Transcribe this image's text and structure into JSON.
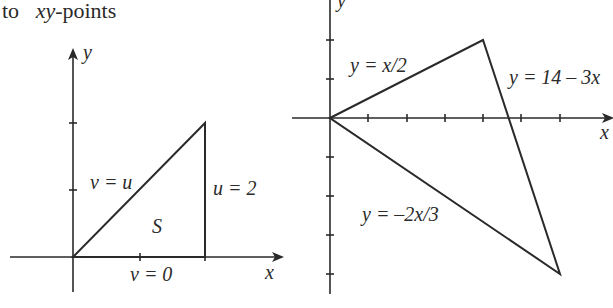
{
  "caption": {
    "prefix": "to",
    "var": "xy",
    "suffix": "-points"
  },
  "left_diagram": {
    "axis_x_label": "x",
    "axis_y_label": "y",
    "region_label": "S",
    "edges": {
      "hypotenuse": "v = u",
      "vertical": "u = 2",
      "base": "v = 0"
    },
    "vertices": [
      [
        0,
        0
      ],
      [
        2,
        2
      ],
      [
        2,
        0
      ]
    ]
  },
  "right_diagram": {
    "axis_x_label": "x",
    "axis_y_label": "y",
    "edges": {
      "upper": "y = x/2",
      "right": "y = 14 – 3x",
      "lower": "y = –2x/3"
    },
    "vertices": [
      [
        0,
        0
      ],
      [
        4,
        2
      ],
      [
        6,
        -4
      ]
    ]
  }
}
